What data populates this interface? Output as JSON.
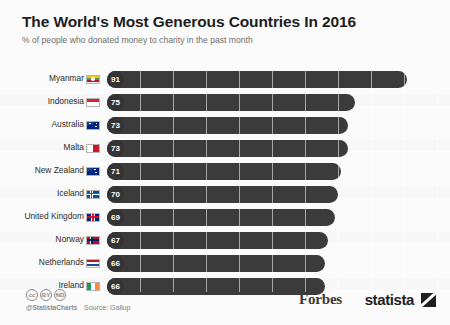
{
  "header": {
    "title": "The World's Most Generous Countries In 2016",
    "subtitle": "% of people who donated money to charity in the past month"
  },
  "footer": {
    "cc_badges": [
      "cc",
      "BY",
      "ND"
    ],
    "handle": "@StatistaCharts",
    "source": "Source: Gallup",
    "forbes_logo": "Forbes",
    "statista_logo": "statista",
    "statista_mark_icon": "statista-arrow-icon"
  },
  "chart_data": {
    "type": "bar",
    "orientation": "horizontal",
    "title": "The World's Most Generous Countries In 2016",
    "subtitle": "% of people who donated money to charity in the past month",
    "xlabel": "",
    "ylabel": "",
    "xlim": [
      0,
      100
    ],
    "grid": true,
    "legend": false,
    "source": "Gallup",
    "categories": [
      "Myanmar",
      "Indonesia",
      "Australia",
      "Malta",
      "New Zealand",
      "Iceland",
      "United Kingdom",
      "Norway",
      "Netherlands",
      "Ireland"
    ],
    "values": [
      91,
      75,
      73,
      73,
      71,
      70,
      69,
      67,
      66,
      66
    ],
    "rows": [
      {
        "label": "Myanmar",
        "value": 91,
        "flag": "flag-myanmar"
      },
      {
        "label": "Indonesia",
        "value": 75,
        "flag": "flag-indonesia"
      },
      {
        "label": "Australia",
        "value": 73,
        "flag": "flag-australia"
      },
      {
        "label": "Malta",
        "value": 73,
        "flag": "flag-malta"
      },
      {
        "label": "New Zealand",
        "value": 71,
        "flag": "flag-new-zealand"
      },
      {
        "label": "Iceland",
        "value": 70,
        "flag": "flag-iceland"
      },
      {
        "label": "United Kingdom",
        "value": 69,
        "flag": "flag-united-kingdom"
      },
      {
        "label": "Norway",
        "value": 67,
        "flag": "flag-norway"
      },
      {
        "label": "Netherlands",
        "value": 66,
        "flag": "flag-netherlands"
      },
      {
        "label": "Ireland",
        "value": 66,
        "flag": "flag-ireland"
      }
    ]
  },
  "colors": {
    "bar": "#3b3b3b",
    "bubble": "#343434",
    "background": "#fbfbfb",
    "title": "#1d1d1d",
    "subtitle": "#6d6d6d"
  }
}
